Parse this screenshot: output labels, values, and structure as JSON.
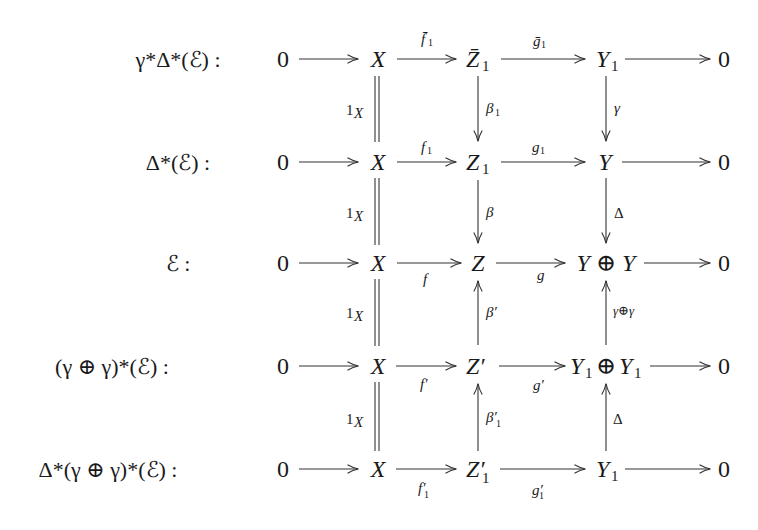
{
  "diagram": {
    "type": "commutative_diagram",
    "rows": [
      {
        "label": "γ*Δ*(ℰ) :",
        "nodes": [
          "0",
          "X",
          "Z̄₁",
          "Y₁",
          "0"
        ],
        "arrows": [
          {
            "from": "0",
            "to": "X",
            "label": ""
          },
          {
            "from": "X",
            "to": "Z̄₁",
            "label": "f̄₁",
            "label_pos": "above"
          },
          {
            "from": "Z̄₁",
            "to": "Y₁",
            "label": "ḡ₁",
            "label_pos": "above"
          },
          {
            "from": "Y₁",
            "to": "0",
            "label": ""
          }
        ]
      },
      {
        "label": "Δ*(ℰ) :",
        "nodes": [
          "0",
          "X",
          "Z₁",
          "Y",
          "0"
        ],
        "arrows": [
          {
            "from": "0",
            "to": "X",
            "label": ""
          },
          {
            "from": "X",
            "to": "Z₁",
            "label": "f₁",
            "label_pos": "above"
          },
          {
            "from": "Z₁",
            "to": "Y",
            "label": "g₁",
            "label_pos": "above"
          },
          {
            "from": "Y",
            "to": "0",
            "label": ""
          }
        ]
      },
      {
        "label": "ℰ :",
        "nodes": [
          "0",
          "X",
          "Z",
          "Y ⊕ Y",
          "0"
        ],
        "arrows": [
          {
            "from": "0",
            "to": "X",
            "label": ""
          },
          {
            "from": "X",
            "to": "Z",
            "label": "f",
            "label_pos": "below"
          },
          {
            "from": "Z",
            "to": "Y ⊕ Y",
            "label": "g",
            "label_pos": "below"
          },
          {
            "from": "Y ⊕ Y",
            "to": "0",
            "label": ""
          }
        ]
      },
      {
        "label": "(γ ⊕ γ)*(ℰ) :",
        "nodes": [
          "0",
          "X",
          "Z′",
          "Y₁ ⊕ Y₁",
          "0"
        ],
        "arrows": [
          {
            "from": "0",
            "to": "X",
            "label": ""
          },
          {
            "from": "X",
            "to": "Z′",
            "label": "f′",
            "label_pos": "below"
          },
          {
            "from": "Z′",
            "to": "Y₁ ⊕ Y₁",
            "label": "g′",
            "label_pos": "below"
          },
          {
            "from": "Y₁ ⊕ Y₁",
            "to": "0",
            "label": ""
          }
        ]
      },
      {
        "label": "Δ*(γ ⊕ γ)*(ℰ) :",
        "nodes": [
          "0",
          "X",
          "Z′₁",
          "Y₁",
          "0"
        ],
        "arrows": [
          {
            "from": "0",
            "to": "X",
            "label": ""
          },
          {
            "from": "X",
            "to": "Z′₁",
            "label": "f′₁",
            "label_pos": "below"
          },
          {
            "from": "Z′₁",
            "to": "Y₁",
            "label": "g′₁",
            "label_pos": "below"
          },
          {
            "from": "Y₁",
            "to": "0",
            "label": ""
          }
        ]
      }
    ],
    "vertical_maps": [
      {
        "between_rows": [
          1,
          2
        ],
        "col_X": {
          "label": "1X",
          "style": "equals"
        },
        "col_Z": {
          "label": "β₁",
          "dir": "down"
        },
        "col_Y": {
          "label": "γ",
          "dir": "down"
        }
      },
      {
        "between_rows": [
          2,
          3
        ],
        "col_X": {
          "label": "1X",
          "style": "equals"
        },
        "col_Z": {
          "label": "β",
          "dir": "down"
        },
        "col_Y": {
          "label": "Δ",
          "dir": "down"
        }
      },
      {
        "between_rows": [
          3,
          4
        ],
        "col_X": {
          "label": "1X",
          "style": "equals"
        },
        "col_Z": {
          "label": "β′",
          "dir": "up"
        },
        "col_Y": {
          "label": "γ⊕γ",
          "dir": "up"
        }
      },
      {
        "between_rows": [
          4,
          5
        ],
        "col_X": {
          "label": "1X",
          "style": "equals"
        },
        "col_Z": {
          "label": "β′₁",
          "dir": "up"
        },
        "col_Y": {
          "label": "Δ",
          "dir": "up"
        }
      }
    ]
  },
  "text": {
    "r1_label_main": "γ*Δ*(ℰ) :",
    "r2_label_main": "Δ*(ℰ) :",
    "r3_label_main": "ℰ :",
    "r4_label_main": "(γ ⊕ γ)*(ℰ) :",
    "r5_label_main": "Δ*(γ ⊕ γ)*(ℰ) :",
    "zero": "0",
    "X": "X",
    "r1_Z": "Z̄",
    "r1_Y": "Y",
    "r2_Z": "Z",
    "r2_Y": "Y",
    "r3_Z": "Z",
    "r3_Y": "Y ⊕ Y",
    "r4_Z": "Z′",
    "r4_Y1": "Y",
    "r4_oplus": "⊕",
    "r4_Y2": "Y",
    "r5_Z": "Z′",
    "r5_Y": "Y",
    "sub1": "1",
    "f1bar": "f̄",
    "g1bar": "ḡ",
    "f1": "f",
    "g1": "g",
    "f": "f",
    "g": "g",
    "fprime": "f′",
    "gprime": "g′",
    "f1prime": "f′",
    "g1prime": "g′",
    "oneX_one": "1",
    "oneX_X": "X",
    "beta1": "β",
    "beta": "β",
    "betaprime": "β′",
    "beta1prime": "β′",
    "gamma": "γ",
    "Delta": "Δ",
    "gammaoplusgamma": "γ⊕γ"
  }
}
